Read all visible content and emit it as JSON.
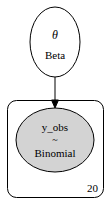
{
  "graph": {
    "nodes": [
      {
        "id": "theta",
        "symbol": "θ",
        "distribution": "Beta",
        "observed": false
      },
      {
        "id": "y_obs",
        "name": "y_obs",
        "tilde": "~",
        "distribution": "Binomial",
        "observed": true
      }
    ],
    "edges": [
      {
        "from": "theta",
        "to": "y_obs"
      }
    ],
    "plate": {
      "size": "20",
      "contains": [
        "y_obs"
      ]
    }
  },
  "colors": {
    "observed_fill": "#d3d3d3",
    "stroke": "#000000",
    "background": "#ffffff"
  }
}
